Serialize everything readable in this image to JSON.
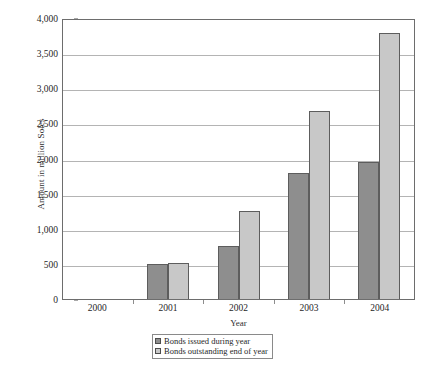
{
  "chart_data": {
    "type": "bar",
    "title": "",
    "xlabel": "Year",
    "ylabel": "Amount in million Soles",
    "categories": [
      "2000",
      "2001",
      "2002",
      "2003",
      "2004"
    ],
    "series": [
      {
        "name": "Bonds issued during year",
        "values": [
          0,
          500,
          750,
          1790,
          1950
        ],
        "color": "#8e8e8e"
      },
      {
        "name": "Bonds outstanding end of year",
        "values": [
          0,
          510,
          1250,
          2680,
          3790
        ],
        "color": "#c8c8c8"
      }
    ],
    "ylim": [
      0,
      4000
    ],
    "yticks": [
      0,
      500,
      1000,
      1500,
      2000,
      2500,
      3000,
      3500,
      4000
    ],
    "ytick_labels": [
      "0",
      "500",
      "1,000",
      "1,500",
      "2,000",
      "2,500",
      "3,000",
      "3,500",
      "4,000"
    ],
    "grid": true,
    "legend_position": "bottom-center"
  },
  "axes": {
    "y_title": "Amount in million Soles",
    "x_title": "Year"
  },
  "legend": {
    "entries": [
      {
        "label": "Bonds issued during year"
      },
      {
        "label": "Bonds outstanding end of year"
      }
    ]
  },
  "caption": {
    "text": ""
  }
}
